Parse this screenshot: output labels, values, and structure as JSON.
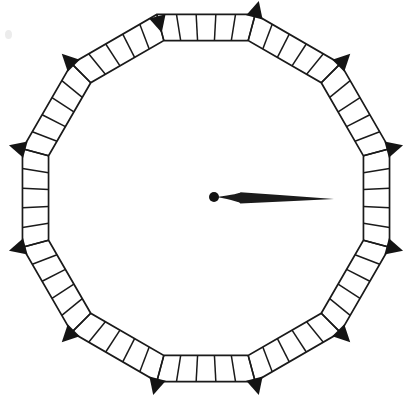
{
  "figure": {
    "title": "Polygonal dial with vertex markers and central pointer",
    "canvas": {
      "width": 409,
      "height": 403,
      "background": "#ffffff"
    },
    "caption": "",
    "ink_color": "#1a1a1a",
    "marker_color": "#141414",
    "needle_color": "#1b1b1b"
  },
  "dial": {
    "name": "dial-ring",
    "type": "polygon-ladder",
    "sides": 12,
    "center": {
      "x": 206,
      "y": 198
    },
    "outer_radius": 190,
    "inner_radius": 163,
    "rotation_degrees": 15,
    "cells_per_side": 5,
    "rail_stroke_width": 1.7,
    "rung_stroke_width": 1.5,
    "vertices": [
      {
        "index": 0,
        "label": "vertex-right",
        "angle_degrees": 0,
        "marker_direction": "outward"
      },
      {
        "index": 1,
        "label": "vertex-upper-right-low",
        "angle_degrees": 30,
        "marker_direction": "outward"
      },
      {
        "index": 2,
        "label": "vertex-upper-right-high",
        "angle_degrees": 60,
        "marker_direction": "outward"
      },
      {
        "index": 3,
        "label": "vertex-top",
        "angle_degrees": 90,
        "marker_direction": "inward"
      },
      {
        "index": 4,
        "label": "vertex-upper-left-high",
        "angle_degrees": 120,
        "marker_direction": "outward"
      },
      {
        "index": 5,
        "label": "vertex-upper-left-low",
        "angle_degrees": 150,
        "marker_direction": "outward"
      },
      {
        "index": 6,
        "label": "vertex-left",
        "angle_degrees": 180,
        "marker_direction": "outward"
      },
      {
        "index": 7,
        "label": "vertex-lower-left-high",
        "angle_degrees": 210,
        "marker_direction": "outward"
      },
      {
        "index": 8,
        "label": "vertex-lower-left-low",
        "angle_degrees": 240,
        "marker_direction": "outward"
      },
      {
        "index": 9,
        "label": "vertex-bottom",
        "angle_degrees": 270,
        "marker_direction": "outward"
      },
      {
        "index": 10,
        "label": "vertex-lower-right-low",
        "angle_degrees": 300,
        "marker_direction": "outward"
      },
      {
        "index": 11,
        "label": "vertex-lower-right-high",
        "angle_degrees": 330,
        "marker_direction": "outward"
      }
    ]
  },
  "pointer": {
    "name": "center-needle",
    "hub": {
      "x": 214,
      "y": 197,
      "radius": 5
    },
    "tip": {
      "x": 334,
      "y": 199
    },
    "max_half_width": 6,
    "direction_degrees": 0,
    "direction_label": "right"
  },
  "artifact": {
    "name": "scan-speck",
    "x": 5,
    "y": 30,
    "width": 7,
    "height": 9
  }
}
